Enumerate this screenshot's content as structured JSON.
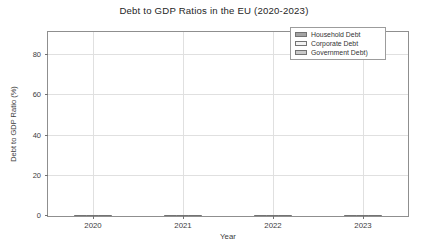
{
  "chart_data": {
    "type": "bar",
    "title": "Debt to GDP Ratios in the EU (2020-2023)",
    "xlabel": "Year",
    "ylabel": "Debt to GDP Ratio (%)",
    "categories": [
      "2020",
      "2021",
      "2022",
      "2023"
    ],
    "series": [
      {
        "name": "Household Debt",
        "color": "#a3a3a3",
        "edge": "#737373",
        "values": [
          51,
          50,
          50,
          50
        ]
      },
      {
        "name": "Corporate Debt",
        "color": "#f2f2f2",
        "edge": "#737373",
        "values": [
          72,
          73,
          75,
          76
        ]
      },
      {
        "name": "Government Debt)",
        "color": "#c9c9c9",
        "edge": "#737373",
        "values": [
          83,
          82,
          90,
          80
        ]
      }
    ],
    "yticks": [
      0,
      20,
      40,
      60,
      80
    ],
    "ylim": [
      0,
      91.5
    ],
    "grid": "both",
    "legend_position": "upper right",
    "colors": {
      "background": "#ffffff",
      "gridline": "#e0e0e0",
      "spine": "#8f8f8f",
      "text": "#3d3d3d"
    }
  }
}
